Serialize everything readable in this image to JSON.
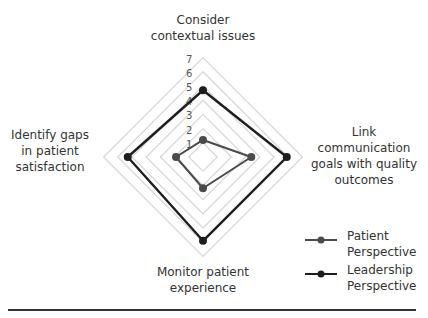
{
  "chart_data": {
    "type": "radar",
    "title": "",
    "categories": [
      "Consider contextual issues",
      "Link communication goals with quality outcomes",
      "Monitor patient experience",
      "Identify gaps in patient satisfaction"
    ],
    "category_lines": [
      [
        "Consider",
        "contextual issues"
      ],
      [
        "Link",
        "communication",
        "goals with quality",
        "outcomes"
      ],
      [
        "Monitor patient",
        "experience"
      ],
      [
        "Identify gaps",
        "in patient",
        "satisfaction"
      ]
    ],
    "series": [
      {
        "name": "Patient Perspective",
        "name_lines": [
          "Patient",
          "Perspective"
        ],
        "values": [
          1.2,
          3.4,
          2.2,
          1.9
        ],
        "color": "#4a4a4a"
      },
      {
        "name": "Leadership Perspective",
        "name_lines": [
          "Leadership",
          "Perspective"
        ],
        "values": [
          4.7,
          5.9,
          5.9,
          5.3
        ],
        "color": "#1e1e1e"
      }
    ],
    "rlim": [
      0,
      7
    ],
    "ticks": [
      "1",
      "2",
      "3",
      "4",
      "5",
      "6",
      "7"
    ],
    "grid": true,
    "grid_color": "#d9d9d9",
    "legend_position": "bottom-right"
  }
}
